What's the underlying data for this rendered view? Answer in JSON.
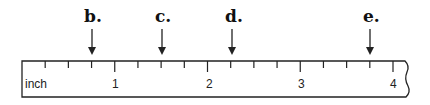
{
  "ruler": {
    "unit_label": "inch",
    "major_labels": [
      "1",
      "2",
      "3",
      "4"
    ],
    "ticks_per_inch": 4
  },
  "arrows": [
    {
      "label": "b.",
      "x": 92
    },
    {
      "label": "c.",
      "x": 162
    },
    {
      "label": "d.",
      "x": 232
    },
    {
      "label": "e.",
      "x": 370
    }
  ],
  "colors": {
    "line": "#222222",
    "background": "#ffffff"
  }
}
